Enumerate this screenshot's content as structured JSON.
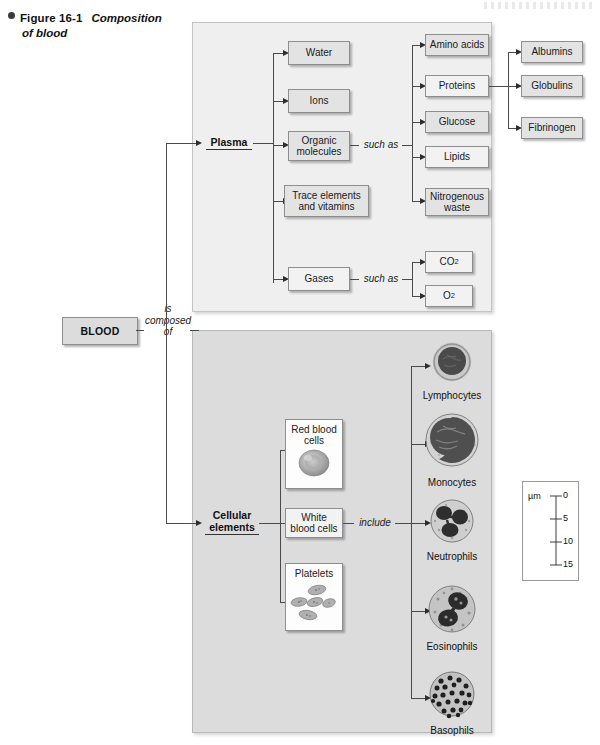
{
  "caption": {
    "bullet": "bullet-dot",
    "figure_number": "Figure 16-1",
    "title_line1": "Composition",
    "title_line2": "of blood"
  },
  "root": {
    "label": "BLOOD",
    "connector_line1": "is",
    "connector_line2": "composed",
    "connector_line3": "of"
  },
  "plasma": {
    "label": "Plasma",
    "components": [
      {
        "label": "Water"
      },
      {
        "label": "Ions"
      },
      {
        "label": "Organic molecules",
        "line1": "Organic",
        "line2": "molecules"
      },
      {
        "label": "Trace elements and vitamins",
        "line1": "Trace elements",
        "line2": "and vitamins"
      },
      {
        "label": "Gases"
      }
    ],
    "such_as_1": "such as",
    "organic_examples": [
      {
        "label": "Amino acids"
      },
      {
        "label": "Proteins"
      },
      {
        "label": "Glucose"
      },
      {
        "label": "Lipids"
      },
      {
        "label": "Nitrogenous waste",
        "line1": "Nitrogenous",
        "line2": "waste"
      }
    ],
    "protein_types": [
      {
        "label": "Albumins"
      },
      {
        "label": "Globulins"
      },
      {
        "label": "Fibrinogen"
      }
    ],
    "such_as_2": "such as",
    "gas_examples": [
      {
        "label": "CO2",
        "base": "CO",
        "sub": "2"
      },
      {
        "label": "O2",
        "base": "O",
        "sub": "2"
      }
    ]
  },
  "cellular": {
    "label_line1": "Cellular",
    "label_line2": "elements",
    "components": [
      {
        "label": "Red blood cells",
        "line1": "Red blood",
        "line2": "cells",
        "image": "red-blood-cell-micrograph"
      },
      {
        "label": "White blood cells",
        "line1": "White",
        "line2": "blood cells"
      },
      {
        "label": "Platelets",
        "line1": "Platelets",
        "image": "platelets-micrograph"
      }
    ],
    "include_word": "include",
    "white_blood_cells": [
      {
        "label": "Lymphocytes",
        "image": "lymphocyte-micrograph"
      },
      {
        "label": "Monocytes",
        "image": "monocyte-micrograph"
      },
      {
        "label": "Neutrophils",
        "image": "neutrophil-micrograph"
      },
      {
        "label": "Eosinophils",
        "image": "eosinophil-micrograph"
      },
      {
        "label": "Basophils",
        "image": "basophil-micrograph"
      }
    ]
  },
  "scale": {
    "unit": "µm",
    "ticks": [
      "0",
      "5",
      "10",
      "15"
    ]
  },
  "colors": {
    "plasma_panel": "#efefef",
    "cellular_panel": "#dcdcdc",
    "box_fill": "#e3e3e3",
    "line": "#4a4a4a",
    "text": "#1a1a1a"
  }
}
